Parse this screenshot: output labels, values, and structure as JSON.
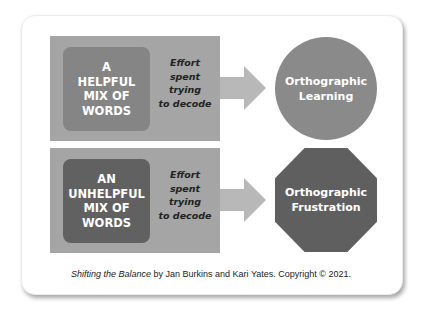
{
  "diagram": {
    "rows": [
      {
        "input_lines": [
          "A",
          "HELPFUL",
          "MIX OF",
          "WORDS"
        ],
        "process_lines": [
          "Effort",
          "spent",
          "trying",
          "to decode"
        ],
        "outcome_lines": [
          "Orthographic",
          "Learning"
        ],
        "outcome_shape": "circle"
      },
      {
        "input_lines": [
          "AN",
          "UNHELPFUL",
          "MIX OF",
          "WORDS"
        ],
        "process_lines": [
          "Effort",
          "spent",
          "trying",
          "to decode"
        ],
        "outcome_lines": [
          "Orthographic",
          "Frustration"
        ],
        "outcome_shape": "octagon"
      }
    ],
    "icons": [
      "arrow-right-icon",
      "arrow-right-icon"
    ],
    "colors": {
      "panel": "#a5a5a5",
      "helpful_box": "#858585",
      "unhelpful_box": "#616161",
      "learning_circle": "#8a8a8a",
      "frustration_octagon": "#5f5f5f",
      "arrow": "#b8b8b8"
    }
  },
  "caption": {
    "title": "Shifting the Balance",
    "rest": " by Jan Burkins and Kari Yates. Copyright © 2021."
  }
}
